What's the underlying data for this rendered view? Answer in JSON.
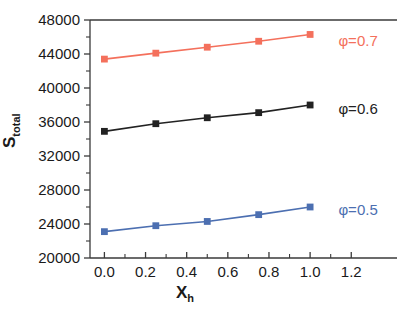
{
  "chart_data": {
    "type": "line",
    "title": "",
    "subtitle": "",
    "xlabel": "X",
    "xlabel_sub": "h",
    "ylabel": "S",
    "ylabel_sub": "total",
    "x": [
      0.0,
      0.25,
      0.5,
      0.75,
      1.0
    ],
    "xlim": [
      -0.07,
      1.33
    ],
    "ylim": [
      20000,
      48000
    ],
    "xticks": [
      "0.0",
      "0.2",
      "0.4",
      "0.6",
      "0.8",
      "1.0",
      "1.2"
    ],
    "xtick_values": [
      0.0,
      0.2,
      0.4,
      0.6,
      0.8,
      1.0,
      1.2
    ],
    "yticks": [
      "20000",
      "24000",
      "28000",
      "32000",
      "36000",
      "40000",
      "44000",
      "48000"
    ],
    "ytick_values": [
      20000,
      24000,
      28000,
      32000,
      36000,
      40000,
      44000,
      48000
    ],
    "minor_ticks": true,
    "grid": false,
    "legend_position": "inline-right",
    "series": [
      {
        "name": "φ=0.7",
        "color": "#f4705c",
        "marker": "square",
        "values": [
          43400,
          44100,
          44800,
          45500,
          46300
        ],
        "label_x": 1.05,
        "label_y": 45500
      },
      {
        "name": "φ=0.6",
        "color": "#222222",
        "marker": "square",
        "values": [
          34900,
          35800,
          36500,
          37100,
          38000
        ],
        "label_x": 1.05,
        "label_y": 37500
      },
      {
        "name": "φ=0.5",
        "color": "#4c6fb1",
        "marker": "square",
        "values": [
          23100,
          23800,
          24300,
          25100,
          26000
        ],
        "label_x": 1.05,
        "label_y": 25700
      }
    ],
    "axis_color": "#3a3a3a",
    "background": "#ffffff"
  }
}
